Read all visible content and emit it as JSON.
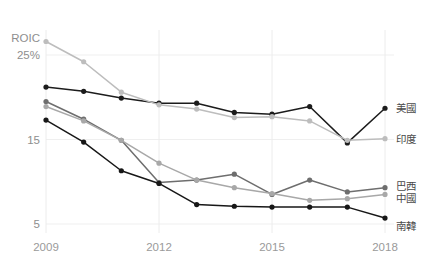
{
  "chart_data": {
    "type": "line",
    "title": "",
    "xlabel": "",
    "ylabel": "ROIC",
    "y_unit": "25%",
    "ylim": [
      3.5,
      27.5
    ],
    "xlim": [
      2009,
      2018
    ],
    "grid": true,
    "legend_position": "right",
    "y_ticks": [
      {
        "value": 25,
        "label": "25%"
      },
      {
        "value": 15,
        "label": "15"
      },
      {
        "value": 5,
        "label": "5"
      }
    ],
    "y_axis_caption": "ROIC",
    "x_ticks": [
      {
        "value": 2009,
        "label": "2009"
      },
      {
        "value": 2012,
        "label": "2012"
      },
      {
        "value": 2015,
        "label": "2015"
      },
      {
        "value": 2018,
        "label": "2018"
      }
    ],
    "x": [
      2009,
      2010,
      2011,
      2012,
      2013,
      2014,
      2015,
      2016,
      2017,
      2018
    ],
    "series": [
      {
        "name": "美國",
        "color": "#1c1c1c",
        "values": [
          21.2,
          20.7,
          19.9,
          19.3,
          19.3,
          18.2,
          18.0,
          18.9,
          14.6,
          18.7
        ]
      },
      {
        "name": "印度",
        "color": "#bdbdbd",
        "values": [
          26.6,
          24.2,
          20.6,
          19.1,
          18.6,
          17.6,
          17.7,
          17.2,
          14.9,
          15.1
        ]
      },
      {
        "name": "巴西",
        "color": "#6e6e6e",
        "values": [
          19.5,
          17.4,
          14.9,
          9.9,
          10.2,
          10.9,
          8.5,
          10.2,
          8.8,
          9.3
        ]
      },
      {
        "name": "中國",
        "color": "#a8a8a8",
        "values": [
          18.9,
          17.2,
          14.9,
          12.2,
          10.2,
          9.3,
          8.6,
          7.8,
          8.0,
          8.5
        ]
      },
      {
        "name": "南韓",
        "color": "#171717",
        "values": [
          17.3,
          14.7,
          11.3,
          9.8,
          7.3,
          7.1,
          7.0,
          7.0,
          7.0,
          5.7
        ]
      }
    ]
  }
}
